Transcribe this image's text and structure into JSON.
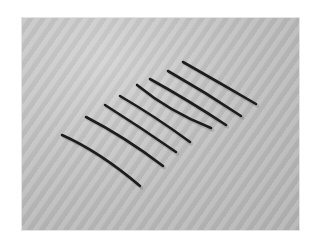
{
  "image": {
    "description": "Photograph of eight dark curved strands arranged diagonally in parallel on a gray textured surface",
    "background_color": "#c4c4c4",
    "border_color": "#ffffff",
    "strand_color": "#1c1c1c",
    "strand_count": 8,
    "strands": [
      {
        "d": "M62,135 Q100,152 140,186"
      },
      {
        "d": "M86,117 Q125,137 163,166"
      },
      {
        "d": "M105,105 Q140,127 176,152"
      },
      {
        "d": "M120,96 Q156,117 190,142"
      },
      {
        "d": "M137,85 Q170,112 211,128"
      },
      {
        "d": "M150,79 Q188,100 226,125"
      },
      {
        "d": "M168,71 Q205,92 241,116"
      },
      {
        "d": "M183,62 Q220,83 256,104"
      }
    ]
  }
}
